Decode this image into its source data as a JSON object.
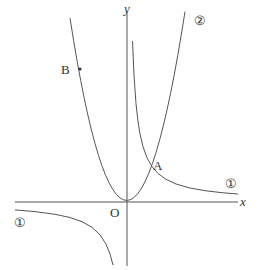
{
  "diagram": {
    "axes": {
      "x_label": "x",
      "y_label": "y",
      "origin_label": "O"
    },
    "curves": [
      {
        "id": "curve-1",
        "label": "①",
        "type": "hyperbola",
        "description": "inverse proportion, two branches (quadrants I and III)"
      },
      {
        "id": "curve-2",
        "label": "②",
        "type": "parabola",
        "description": "upward parabola with vertex at origin"
      }
    ],
    "points": [
      {
        "label": "A",
        "description": "intersection of ① and ② in quadrant I"
      },
      {
        "label": "B",
        "description": "point on ② in quadrant II"
      }
    ],
    "colors": {
      "line": "#555555",
      "text": "#333333",
      "background": "#ffffff"
    }
  }
}
